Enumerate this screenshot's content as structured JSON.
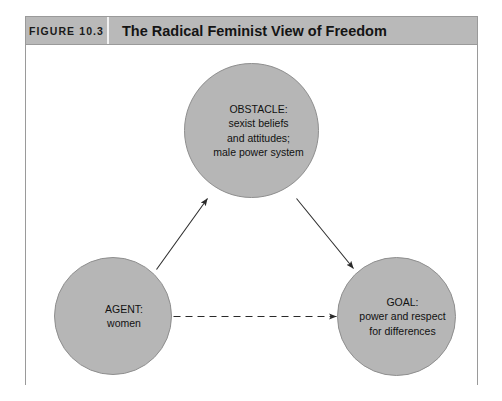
{
  "figure": {
    "number_label": "FIGURE 10.3",
    "title": "The Radical Feminist View of Freedom"
  },
  "diagram": {
    "type": "node-link concept diagram",
    "nodes": [
      {
        "id": "obstacle",
        "role": "obstacle",
        "lines": [
          "OBSTACLE:",
          "sexist beliefs",
          "and attitudes;",
          "male power system"
        ]
      },
      {
        "id": "agent",
        "role": "agent",
        "lines": [
          "AGENT:",
          "women"
        ]
      },
      {
        "id": "goal",
        "role": "goal",
        "lines": [
          "GOAL:",
          "power and respect",
          "for differences"
        ]
      }
    ],
    "edges": [
      {
        "id": "agent-to-obstacle",
        "from": "agent",
        "to": "obstacle",
        "style": "solid",
        "arrow": "single"
      },
      {
        "id": "obstacle-to-goal",
        "from": "obstacle",
        "to": "goal",
        "style": "solid",
        "arrow": "single"
      },
      {
        "id": "agent-to-goal",
        "from": "agent",
        "to": "goal",
        "style": "dashed",
        "arrow": "single"
      }
    ],
    "colors": {
      "node_fill": "#b6b6b6",
      "node_stroke": "#8f8f8f",
      "edge_stroke": "#2a2a2a",
      "header_bar": "#b9b9b9",
      "frame_stroke": "#9a9a9a",
      "page_background": "#ffffff"
    }
  }
}
